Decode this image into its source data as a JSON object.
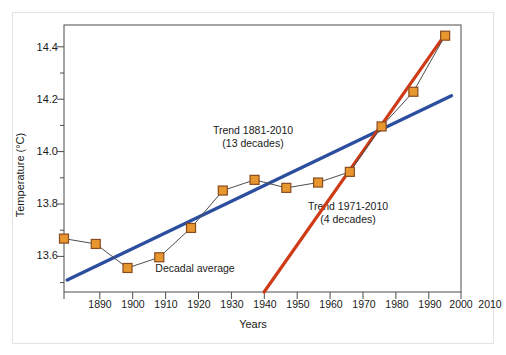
{
  "figure": {
    "background_color": "#ffffff",
    "frame_color": "#e3e3e3",
    "axis_color": "#4d4d4d"
  },
  "chart_data": {
    "type": "line",
    "title": "",
    "xlabel": "Years",
    "ylabel": "Temperature (°C)",
    "xlim": [
      1885,
      2010
    ],
    "ylim": [
      13.5,
      14.5
    ],
    "grid": false,
    "legend_position": "none",
    "x_ticks": [
      1890,
      1900,
      1910,
      1920,
      1930,
      1940,
      1950,
      1960,
      1970,
      1980,
      1990,
      2000,
      2010
    ],
    "x_tick_labels": [
      "1890",
      "1900",
      "1910",
      "1920",
      "1930",
      "1940",
      "1950",
      "1960",
      "1970",
      "1980",
      "1990",
      "2000",
      "2010"
    ],
    "y_ticks": [
      13.6,
      13.8,
      14.0,
      14.2,
      14.4
    ],
    "y_tick_labels": [
      "13.6",
      "13.8",
      "14.0",
      "14.2",
      "14.4"
    ],
    "y_minor_ticks": [
      13.5,
      13.7,
      13.9,
      14.1,
      14.3
    ],
    "series": [
      {
        "name": "Decadal average",
        "type": "line",
        "marker": "square",
        "marker_color": "#e8972e",
        "marker_edge_color": "#8a4b1e",
        "line_color": "#4d4d4d",
        "x": [
          1885,
          1895,
          1905,
          1915,
          1925,
          1935,
          1945,
          1955,
          1965,
          1975,
          1985,
          1995,
          2005
        ],
        "values": [
          13.7,
          13.68,
          13.59,
          13.63,
          13.74,
          13.88,
          13.92,
          13.89,
          13.91,
          13.95,
          14.12,
          14.25,
          14.46
        ]
      },
      {
        "name": "Trend 1881-2010",
        "type": "trend-line",
        "line_color": "#2b4f9e",
        "x": [
          1886,
          2007
        ],
        "values": [
          13.545,
          14.235
        ]
      },
      {
        "name": "Trend 1971-2010",
        "type": "trend-line",
        "line_color": "#cf3a17",
        "x": [
          1948,
          2005
        ],
        "values": [
          13.5,
          14.465
        ]
      }
    ],
    "annotations": [
      {
        "text": "Trend 1881-2010",
        "x": 1942,
        "y": 14.105,
        "for_series": "Trend 1881-2010"
      },
      {
        "text": "(13 decades)",
        "x": 1942,
        "y": 14.06,
        "for_series": "Trend 1881-2010"
      },
      {
        "text": "Trend 1971-2010",
        "x": 1975,
        "y": 13.81,
        "for_series": "Trend 1971-2010"
      },
      {
        "text": "(4 decades)",
        "x": 1975,
        "y": 13.765,
        "for_series": "Trend 1971-2010"
      },
      {
        "text": "Decadal average",
        "x": 1911,
        "y": 13.54,
        "for_series": "Decadal average"
      }
    ]
  },
  "annotation_text": {
    "blue_line_1": "Trend 1881-2010",
    "blue_line_2": "(13 decades)",
    "red_line_1": "Trend 1971-2010",
    "red_line_2": "(4 decades)",
    "decadal": "Decadal average"
  },
  "ticks": {
    "y": [
      "14.4",
      "14.2",
      "14.0",
      "13.8",
      "13.6"
    ],
    "x": [
      "1890",
      "1900",
      "1910",
      "1920",
      "1930",
      "1940",
      "1950",
      "1960",
      "1970",
      "1980",
      "1990",
      "2000",
      "2010"
    ]
  },
  "labels": {
    "y_axis_title": "Temperature (°C)",
    "x_axis_title": "Years"
  }
}
